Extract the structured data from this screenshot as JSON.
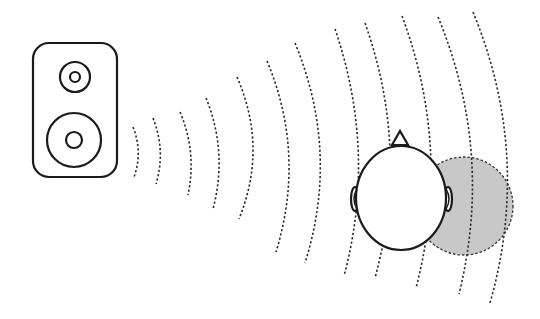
{
  "diagram": {
    "description": "Sound waves from a loudspeaker reach a listener's head; the head casts an acoustic shadow on the far side",
    "colors": {
      "stroke": "#1a1a1a",
      "wave": "#2a2a2a",
      "shadow_fill": "#c8c8c8",
      "background": "#ffffff"
    },
    "elements": {
      "speaker": {
        "label": "loudspeaker",
        "drivers": [
          "tweeter",
          "woofer"
        ]
      },
      "waves": {
        "label": "sound-waves",
        "count": 12,
        "style": "dashed arcs"
      },
      "head": {
        "label": "listener-head",
        "view": "top",
        "features": [
          "nose",
          "left-ear",
          "right-ear"
        ]
      },
      "shadow": {
        "label": "acoustic-shadow",
        "style": "grey fill, dashed outline"
      }
    }
  }
}
